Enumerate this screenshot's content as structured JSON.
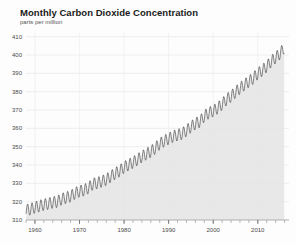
{
  "header": {
    "title": "Monthly Carbon Dioxide Concentration",
    "subtitle": "parts per million"
  },
  "chart_data": {
    "type": "line",
    "title": "Monthly Carbon Dioxide Concentration",
    "subtitle": "parts per million",
    "xlabel": "",
    "ylabel": "parts per million",
    "xlim": [
      1958,
      2017
    ],
    "ylim": [
      310,
      412
    ],
    "yticks": [
      310,
      320,
      330,
      340,
      350,
      360,
      370,
      380,
      390,
      400,
      410
    ],
    "ytick_labels": [
      "310",
      "320",
      "330",
      "340",
      "350",
      "360",
      "370",
      "380",
      "390",
      "400",
      "410"
    ],
    "xticks": [
      1960,
      1970,
      1980,
      1990,
      2000,
      2010
    ],
    "xtick_labels": [
      "1960",
      "1970",
      "1980",
      "1990",
      "2000",
      "2010"
    ],
    "x_minor_tick_interval": 2,
    "grid": {
      "horizontal": true,
      "vertical": true
    },
    "legend": null,
    "area_fill": true,
    "seasonal_amplitude": 3.2,
    "series": [
      {
        "name": "Monthly mean CO2",
        "description": "Mauna Loa monthly mean atmospheric CO2 with seasonal sawtooth cycle",
        "x": [
          1958,
          1959,
          1960,
          1961,
          1962,
          1963,
          1964,
          1965,
          1966,
          1967,
          1968,
          1969,
          1970,
          1971,
          1972,
          1973,
          1974,
          1975,
          1976,
          1977,
          1978,
          1979,
          1980,
          1981,
          1982,
          1983,
          1984,
          1985,
          1986,
          1987,
          1988,
          1989,
          1990,
          1991,
          1992,
          1993,
          1994,
          1995,
          1996,
          1997,
          1998,
          1999,
          2000,
          2001,
          2002,
          2003,
          2004,
          2005,
          2006,
          2007,
          2008,
          2009,
          2010,
          2011,
          2012,
          2013,
          2014,
          2015,
          2016
        ],
        "values": [
          315.3,
          315.9,
          316.9,
          317.6,
          318.4,
          318.9,
          319.6,
          320.0,
          321.4,
          322.2,
          323.0,
          324.6,
          325.7,
          326.3,
          327.5,
          329.7,
          330.2,
          331.1,
          332.0,
          333.8,
          335.4,
          336.8,
          338.8,
          340.1,
          341.4,
          343.0,
          344.6,
          346.0,
          347.4,
          349.2,
          351.6,
          353.1,
          354.4,
          355.6,
          356.4,
          357.1,
          358.8,
          360.8,
          362.6,
          363.7,
          366.7,
          368.4,
          369.5,
          371.1,
          373.2,
          375.8,
          377.5,
          379.8,
          381.9,
          383.8,
          385.6,
          387.4,
          389.9,
          391.6,
          393.8,
          396.5,
          398.6,
          400.8,
          404.2
        ],
        "color": "#3a3a3a"
      }
    ]
  }
}
